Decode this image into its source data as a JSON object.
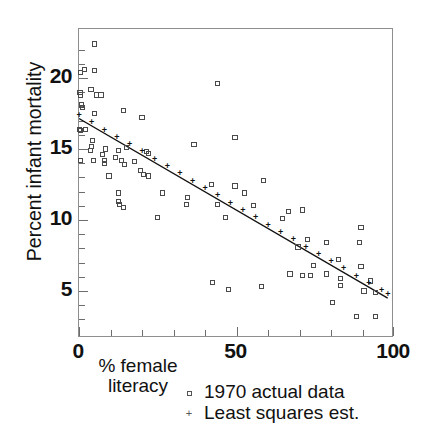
{
  "chart_data": {
    "type": "scatter",
    "title": "",
    "xlabel": "% female literacy",
    "ylabel": "Percent infant mortality",
    "xlim": [
      0,
      100
    ],
    "ylim": [
      2.6,
      22.7
    ],
    "grid": false,
    "legend_position": "below-axis-right",
    "x_ticks_major": [
      0,
      50,
      100
    ],
    "x_tick_labels": [
      "0",
      "50",
      "100"
    ],
    "x_ticks_minor": [
      10,
      20,
      30,
      40,
      60,
      70,
      80,
      90
    ],
    "y_ticks_major": [
      5,
      10,
      15,
      20
    ],
    "y_tick_labels": [
      "5",
      "10",
      "15",
      "20"
    ],
    "y_ticks_minor": [
      3,
      4,
      6,
      7,
      8,
      9,
      11,
      12,
      13,
      14,
      16,
      17,
      18,
      19,
      21,
      22
    ],
    "series": [
      {
        "name": "1970 actual data",
        "marker": "open-square",
        "color": "#4a4a4a",
        "points": [
          [
            5.0,
            22.4
          ],
          [
            0.5,
            20.4
          ],
          [
            1.8,
            20.6
          ],
          [
            5.0,
            20.5
          ],
          [
            0.3,
            19.0
          ],
          [
            0.6,
            18.8
          ],
          [
            3.8,
            19.2
          ],
          [
            5.5,
            18.8
          ],
          [
            7.0,
            18.8
          ],
          [
            0.8,
            18.1
          ],
          [
            1.0,
            17.9
          ],
          [
            4.8,
            17.5
          ],
          [
            14.0,
            17.7
          ],
          [
            20.0,
            17.2
          ],
          [
            0.2,
            16.4
          ],
          [
            0.4,
            16.3
          ],
          [
            2.0,
            16.4
          ],
          [
            44.0,
            19.6
          ],
          [
            49.5,
            15.8
          ],
          [
            36.5,
            15.3
          ],
          [
            4.2,
            15.6
          ],
          [
            4.0,
            15.2
          ],
          [
            3.6,
            14.9
          ],
          [
            8.5,
            15.0
          ],
          [
            12.5,
            14.9
          ],
          [
            15.0,
            15.1
          ],
          [
            21.5,
            14.8
          ],
          [
            22.0,
            14.7
          ],
          [
            0.5,
            14.2
          ],
          [
            4.5,
            14.2
          ],
          [
            7.5,
            14.6
          ],
          [
            8.0,
            14.2
          ],
          [
            8.2,
            14.0
          ],
          [
            11.5,
            14.4
          ],
          [
            13.5,
            14.2
          ],
          [
            14.5,
            13.9
          ],
          [
            17.5,
            14.1
          ],
          [
            19.5,
            13.5
          ],
          [
            20.5,
            13.2
          ],
          [
            22.0,
            13.1
          ],
          [
            9.5,
            13.1
          ],
          [
            58.5,
            12.8
          ],
          [
            42.0,
            12.5
          ],
          [
            49.5,
            12.4
          ],
          [
            52.5,
            11.9
          ],
          [
            26.5,
            11.9
          ],
          [
            34.5,
            11.6
          ],
          [
            34.0,
            11.1
          ],
          [
            44.0,
            11.1
          ],
          [
            55.5,
            11.0
          ],
          [
            12.5,
            11.9
          ],
          [
            12.5,
            11.3
          ],
          [
            12.8,
            11.1
          ],
          [
            14.0,
            10.9
          ],
          [
            64.5,
            10.1
          ],
          [
            66.5,
            10.6
          ],
          [
            71.0,
            10.7
          ],
          [
            46.5,
            10.2
          ],
          [
            25.0,
            10.2
          ],
          [
            89.5,
            9.5
          ],
          [
            72.5,
            8.6
          ],
          [
            78.5,
            8.4
          ],
          [
            89.0,
            8.4
          ],
          [
            69.5,
            8.1
          ],
          [
            82.5,
            7.2
          ],
          [
            74.5,
            6.8
          ],
          [
            89.5,
            6.7
          ],
          [
            67.0,
            6.2
          ],
          [
            71.0,
            6.1
          ],
          [
            73.5,
            6.1
          ],
          [
            78.5,
            6.2
          ],
          [
            83.0,
            5.9
          ],
          [
            83.0,
            5.4
          ],
          [
            92.5,
            5.7
          ],
          [
            90.5,
            5.0
          ],
          [
            94.0,
            4.9
          ],
          [
            42.5,
            5.6
          ],
          [
            47.5,
            5.1
          ],
          [
            58.0,
            5.3
          ],
          [
            80.5,
            4.2
          ],
          [
            88.0,
            3.2
          ],
          [
            94.0,
            3.2
          ]
        ]
      },
      {
        "name": "Least squares est.",
        "marker": "plus",
        "color": "#111111",
        "fit_line": {
          "x0": 0,
          "y0": 17.15,
          "x1": 98,
          "y1": 4.5
        },
        "points": [
          [
            0,
            17.15
          ],
          [
            4,
            16.64
          ],
          [
            8,
            16.12
          ],
          [
            12,
            15.61
          ],
          [
            16,
            15.09
          ],
          [
            20,
            14.58
          ],
          [
            24,
            14.06
          ],
          [
            28,
            13.55
          ],
          [
            32,
            13.03
          ],
          [
            36,
            12.52
          ],
          [
            40,
            12.0
          ],
          [
            44,
            11.49
          ],
          [
            48,
            10.97
          ],
          [
            52,
            10.46
          ],
          [
            56,
            9.94
          ],
          [
            60,
            9.43
          ],
          [
            64,
            8.91
          ],
          [
            68,
            8.4
          ],
          [
            72,
            7.88
          ],
          [
            76,
            7.37
          ],
          [
            80,
            6.85
          ],
          [
            84,
            6.34
          ],
          [
            88,
            5.82
          ],
          [
            92,
            5.31
          ],
          [
            96,
            4.79
          ],
          [
            98,
            4.53
          ]
        ]
      }
    ]
  },
  "axis_titles": {
    "y": "Percent infant mortality",
    "x_line1": "% female",
    "x_line2": "literacy"
  },
  "legend": {
    "entries": [
      {
        "marker": "square",
        "label": "1970 actual data"
      },
      {
        "marker": "plus",
        "label": "Least squares est."
      }
    ]
  },
  "colors": {
    "frame": "#8e8e8e",
    "data_marker": "#4a4a4a",
    "fit_marker": "#111111",
    "text": "#111111"
  }
}
